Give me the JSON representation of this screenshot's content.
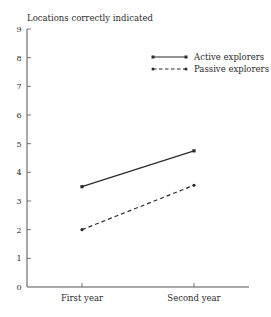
{
  "chart_data": {
    "type": "line",
    "title": "",
    "xlabel": "",
    "ylabel": "Locations correctly indicated",
    "categories": [
      "First year",
      "Second year"
    ],
    "series": [
      {
        "name": "Active explorers",
        "values": [
          3.5,
          4.75
        ],
        "line_style": "solid",
        "color": "#2a2a2a"
      },
      {
        "name": "Passive explorers",
        "values": [
          2.0,
          3.55
        ],
        "line_style": "dashed",
        "color": "#2a2a2a"
      }
    ],
    "ylim": [
      0,
      9
    ],
    "yticks": [
      "0",
      "1",
      "2",
      "3",
      "4",
      "5",
      "6",
      "7",
      "8",
      "9"
    ],
    "grid": false,
    "legend_position": "upper right"
  }
}
